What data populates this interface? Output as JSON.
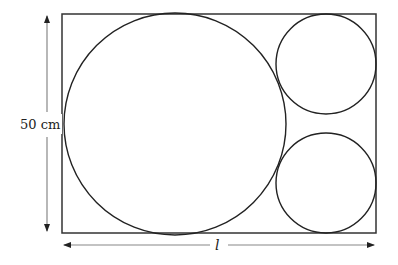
{
  "diagram": {
    "height_label": "50 cm",
    "length_label": "l",
    "rectangle": {
      "x": 62,
      "y": 14,
      "width": 314,
      "height": 219
    },
    "big_circle": {
      "cx": 175,
      "cy": 124,
      "r": 111
    },
    "small_circles": [
      {
        "cx": 326,
        "cy": 64,
        "r": 50
      },
      {
        "cx": 326,
        "cy": 183,
        "r": 50
      }
    ],
    "colors": {
      "stroke": "#222222",
      "arrow": "#555555"
    }
  }
}
